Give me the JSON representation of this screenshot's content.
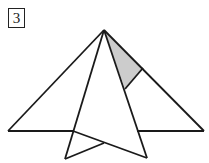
{
  "figure": {
    "label": "3",
    "stroke_color": "#1a1a1a",
    "shade_color": "#cccccc"
  }
}
